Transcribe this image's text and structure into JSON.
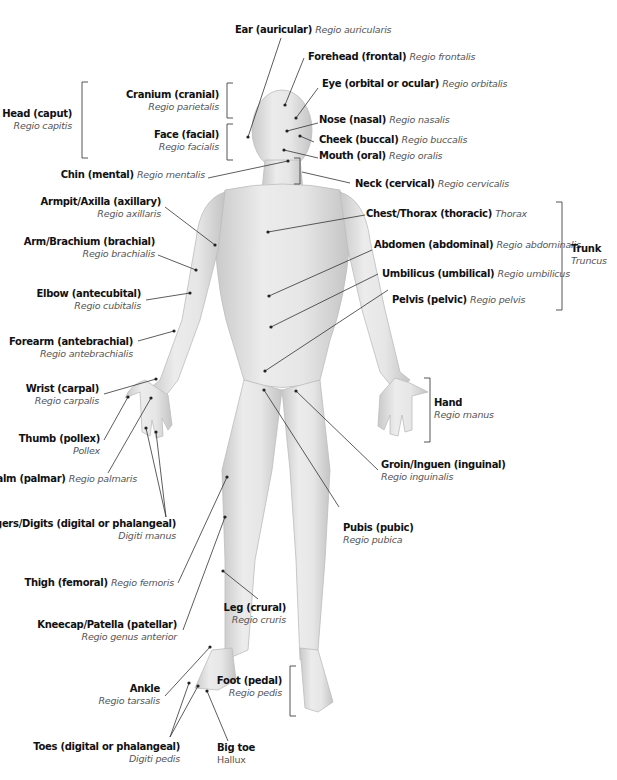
{
  "diagram": {
    "type": "anatomical-regions",
    "colors": {
      "background": "#ffffff",
      "skin": "#dcdcdc",
      "leader_line": "#333333",
      "label_primary": "#111111",
      "label_latin": "#555555"
    },
    "labels": {
      "ear": {
        "en": "Ear (auricular)",
        "la": "Regio auricularis"
      },
      "forehead": {
        "en": "Forehead (frontal)",
        "la": "Regio frontalis"
      },
      "eye": {
        "en": "Eye (orbital or ocular)",
        "la": "Regio orbitalis"
      },
      "cranium": {
        "en": "Cranium (cranial)",
        "la": "Regio parietalis"
      },
      "head": {
        "en": "Head (caput)",
        "la": "Regio capitis"
      },
      "face": {
        "en": "Face (facial)",
        "la": "Regio facialis"
      },
      "nose": {
        "en": "Nose (nasal)",
        "la": "Regio nasalis"
      },
      "cheek": {
        "en": "Cheek (buccal)",
        "la": "Regio buccalis"
      },
      "mouth": {
        "en": "Mouth (oral)",
        "la": "Regio oralis"
      },
      "chin": {
        "en": "Chin (mental)",
        "la": "Regio mentalis"
      },
      "neck": {
        "en": "Neck (cervical)",
        "la": "Regio cervicalis"
      },
      "armpit": {
        "en": "Armpit/Axilla (axillary)",
        "la": "Regio axillaris"
      },
      "chest": {
        "en": "Chest/Thorax (thoracic)",
        "la": "Thorax"
      },
      "arm": {
        "en": "Arm/Brachium (brachial)",
        "la": "Regio brachialis"
      },
      "abdomen": {
        "en": "Abdomen (abdominal)",
        "la": "Regio abdominalis"
      },
      "trunk": {
        "en": "Trunk",
        "la": "Truncus"
      },
      "umbilicus": {
        "en": "Umbilicus (umbilical)",
        "la": "Regio umbilicus"
      },
      "elbow": {
        "en": "Elbow (antecubital)",
        "la": "Regio cubitalis"
      },
      "pelvis": {
        "en": "Pelvis (pelvic)",
        "la": "Regio pelvis"
      },
      "forearm": {
        "en": "Forearm (antebrachial)",
        "la": "Regio antebrachialis"
      },
      "wrist": {
        "en": "Wrist (carpal)",
        "la": "Regio carpalis"
      },
      "hand": {
        "en": "Hand",
        "la": "Regio manus"
      },
      "thumb": {
        "en": "Thumb (pollex)",
        "la": "Pollex"
      },
      "groin": {
        "en": "Groin/Inguen (inguinal)",
        "la": "Regio inguinalis"
      },
      "palm": {
        "en": "Palm (palmar)",
        "la": "Regio palmaris"
      },
      "fingers": {
        "en": "Fingers/Digits (digital or phalangeal)",
        "la": "Digiti manus"
      },
      "pubis": {
        "en": "Pubis (pubic)",
        "la": "Regio pubica"
      },
      "thigh": {
        "en": "Thigh (femoral)",
        "la": "Regio femoris"
      },
      "leg": {
        "en": "Leg (crural)",
        "la": "Regio cruris"
      },
      "kneecap": {
        "en": "Kneecap/Patella (patellar)",
        "la": "Regio genus anterior"
      },
      "ankle": {
        "en": "Ankle",
        "la": "Regio tarsalis"
      },
      "foot": {
        "en": "Foot (pedal)",
        "la": "Regio pedis"
      },
      "toes": {
        "en": "Toes (digital or phalangeal)",
        "la": "Digiti pedis"
      },
      "bigtoe": {
        "en": "Big toe",
        "la": "Hallux"
      }
    }
  }
}
